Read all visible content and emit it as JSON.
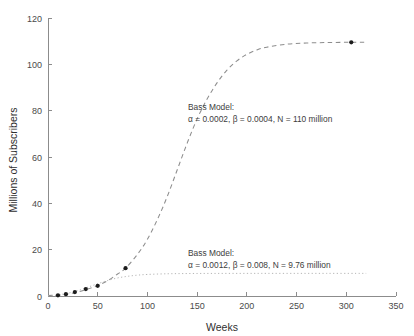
{
  "chart_data": {
    "type": "line",
    "title": "",
    "xlabel": "Weeks",
    "ylabel": "Millions of Subscribers",
    "xlim": [
      0,
      350
    ],
    "ylim": [
      0,
      120
    ],
    "xticks": [
      0,
      50,
      100,
      150,
      200,
      250,
      300,
      350
    ],
    "yticks": [
      0,
      20,
      40,
      60,
      80,
      100,
      120
    ],
    "grid": false,
    "legend": "none",
    "series": [
      {
        "name": "Bass model fit (N = 110 million)",
        "style": "dashed",
        "color": "#8d8d8d",
        "x": [
          0,
          10,
          20,
          30,
          40,
          50,
          60,
          70,
          78,
          90,
          100,
          110,
          120,
          130,
          140,
          150,
          160,
          170,
          180,
          190,
          200,
          210,
          220,
          240,
          260,
          280,
          300,
          305,
          318
        ],
        "y": [
          0.2,
          0.4,
          0.9,
          1.7,
          3.0,
          4.5,
          6.6,
          9.5,
          12.0,
          18.0,
          24.5,
          33.0,
          43.0,
          54.5,
          66.0,
          76.5,
          85.0,
          92.0,
          97.5,
          101.5,
          104.3,
          106.2,
          107.4,
          108.7,
          109.2,
          109.4,
          109.5,
          109.5,
          109.5
        ]
      },
      {
        "name": "Bass model fit (N = 9.76 million)",
        "style": "dotted",
        "color": "#b2b2b2",
        "x": [
          0,
          10,
          20,
          30,
          40,
          50,
          60,
          70,
          80,
          90,
          100,
          120,
          140,
          160,
          180,
          200,
          220,
          250,
          280,
          310,
          320
        ],
        "y": [
          0.1,
          0.5,
          1.2,
          2.3,
          3.8,
          5.3,
          6.7,
          7.8,
          8.5,
          9.0,
          9.3,
          9.6,
          9.7,
          9.74,
          9.75,
          9.76,
          9.76,
          9.76,
          9.76,
          9.76,
          9.76
        ]
      },
      {
        "name": "Observed subscribers",
        "style": "markers",
        "color": "#1c1c1c",
        "x": [
          10,
          18,
          27,
          38,
          50,
          78,
          305
        ],
        "y": [
          0.3,
          0.8,
          1.7,
          3.0,
          4.4,
          12.0,
          109.5
        ]
      }
    ],
    "annotations": [
      {
        "name": "upper-bass-model-annotation",
        "line1": "Bass Model:",
        "line2": "α = 0.0002, β = 0.0004, N = 110 million",
        "x_week": 133,
        "y_value": 84
      },
      {
        "name": "lower-bass-model-annotation",
        "line1": "Bass Model:",
        "line2": "α = 0.0012, β = 0.008, N = 9.76 million",
        "x_week": 133,
        "y_value": 22
      }
    ]
  },
  "axes": {
    "x_title": "Weeks",
    "y_title": "Millions of Subscribers",
    "x_tick_labels": [
      "0",
      "50",
      "100",
      "150",
      "200",
      "250",
      "300",
      "350"
    ],
    "y_tick_labels": [
      "0",
      "20",
      "40",
      "60",
      "80",
      "100",
      "120"
    ]
  },
  "annotations": {
    "upper": {
      "line1": "Bass Model:",
      "line2": "α = 0.0002, β = 0.0004, N = 110 million"
    },
    "lower": {
      "line1": "Bass Model:",
      "line2": "α = 0.0012, β = 0.008, N = 9.76 million"
    }
  },
  "colors": {
    "background": "#ffffff",
    "axis": "#8c8c8c",
    "dashed_curve": "#8d8d8d",
    "dotted_curve": "#b2b2b2",
    "marker": "#1c1c1c",
    "text": "#3a3a3a"
  }
}
